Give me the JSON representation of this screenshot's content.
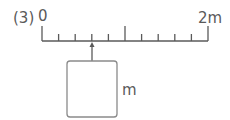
{
  "problem": {
    "number_label": "(3)",
    "ruler": {
      "start_label": "0",
      "end_label": "2m",
      "divisions": 10,
      "major_tick_index": 5,
      "arrow_tick_index": 3
    },
    "answer_box": {
      "value": "",
      "unit_label": "m"
    }
  },
  "colors": {
    "line": "#5a5a5a",
    "box_border": "#8a8a8a"
  }
}
